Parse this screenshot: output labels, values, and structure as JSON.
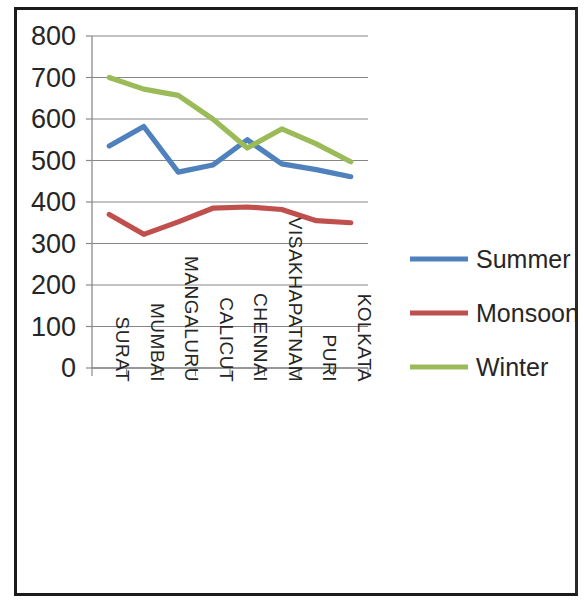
{
  "chart_data": {
    "type": "line",
    "title": "",
    "subtitle": "",
    "xlabel": "",
    "ylabel": "",
    "categories": [
      "SURAT",
      "MUMBAI",
      "MANGALURU",
      "CALICUT",
      "CHENNAI",
      "VISAKHAPATNAM",
      "PURI",
      "KOLKATA"
    ],
    "series": [
      {
        "name": "Summer",
        "color": "#4f81bd",
        "values": [
          535,
          582,
          472,
          489,
          550,
          492,
          478,
          461
        ]
      },
      {
        "name": "Monsoon",
        "color": "#c0504d",
        "values": [
          370,
          322,
          352,
          385,
          388,
          382,
          355,
          350
        ]
      },
      {
        "name": "Winter",
        "color": "#9bbb59",
        "values": [
          700,
          672,
          657,
          600,
          530,
          576,
          540,
          497
        ]
      }
    ],
    "ylim": [
      0,
      800
    ],
    "yticks": [
      0,
      100,
      200,
      300,
      400,
      500,
      600,
      700,
      800
    ],
    "ytick_labels": [
      "0",
      "100",
      "200",
      "300",
      "400",
      "500",
      "600",
      "700",
      "800"
    ],
    "grid": true,
    "grid_axis": "y",
    "legend_position": "right",
    "legend_entries": [
      "Summer",
      "Monsoon",
      "Winter"
    ],
    "xtick_rotation": 90
  },
  "legend": {
    "items": [
      {
        "label": "Summer",
        "color": "#4f81bd"
      },
      {
        "label": "Monsoon",
        "color": "#c0504d"
      },
      {
        "label": "Winter",
        "color": "#9bbb59"
      }
    ]
  }
}
